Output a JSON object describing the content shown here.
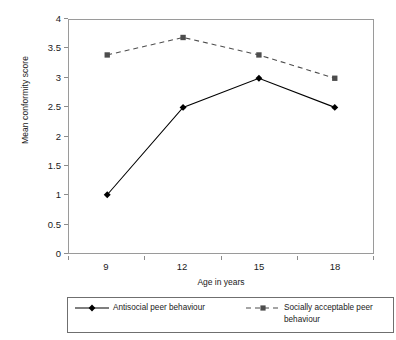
{
  "chart_data": {
    "type": "line",
    "title": "",
    "xlabel": "Age in years",
    "ylabel": "Mean conformity score",
    "categories": [
      "9",
      "12",
      "15",
      "18"
    ],
    "x": [
      9,
      12,
      15,
      18
    ],
    "ylim": [
      0,
      4
    ],
    "yticks": [
      "0",
      "0.5",
      "1",
      "1.5",
      "2",
      "2.5",
      "3",
      "3.5",
      "4"
    ],
    "ytick_values": [
      0,
      0.5,
      1,
      1.5,
      2,
      2.5,
      3,
      3.5,
      4
    ],
    "grid": false,
    "legend_position": "bottom",
    "series": [
      {
        "name": "Antisocial peer behaviour",
        "values": [
          1.0,
          2.5,
          3.0,
          2.5
        ],
        "line_style": "solid",
        "marker": "diamond",
        "color": "#000000"
      },
      {
        "name": "Socially acceptable peer behaviour",
        "values": [
          3.4,
          3.7,
          3.4,
          3.0
        ],
        "line_style": "dashed",
        "marker": "square",
        "color": "#4d4d4d"
      }
    ]
  },
  "axes": {
    "y_title": "Mean conformity score",
    "x_title": "Age in years",
    "y_tick_labels": [
      "4",
      "3.5",
      "3",
      "2.5",
      "2",
      "1.5",
      "1",
      "0.5",
      "0"
    ],
    "x_tick_labels": [
      "9",
      "12",
      "15",
      "18"
    ]
  },
  "legend": {
    "entries": [
      {
        "label": "Antisocial peer behaviour"
      },
      {
        "label": "Socially acceptable peer behaviour"
      }
    ]
  },
  "colors": {
    "series_1": "#000000",
    "series_2": "#4d4d4d",
    "axis": "#8c8c8c",
    "frame": "#9a9a9a",
    "legend_border": "#6f6f6f",
    "background": "#ffffff"
  }
}
